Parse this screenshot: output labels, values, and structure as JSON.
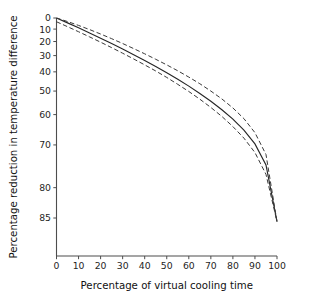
{
  "figure": {
    "background_color": "#ffffff",
    "axis_color": "#4d4d4d",
    "line_color": "#262626",
    "dashed_line_color": "#3a3a3a"
  },
  "chart_data": {
    "type": "line",
    "title": "",
    "subtitle": "",
    "xlabel": "Percentage of virtual cooling time",
    "ylabel": "Percentage reduction in temperature difference",
    "grid": false,
    "legend": "none",
    "y_axis_inverted": true,
    "y_axis_scale": "nonlinear-exponential",
    "xlim": [
      0,
      100
    ],
    "ylim": [
      0,
      87
    ],
    "xticks": [
      0,
      10,
      20,
      30,
      40,
      50,
      60,
      70,
      80,
      90,
      100
    ],
    "xticklabels": [
      "0",
      "10",
      "20",
      "30",
      "40",
      "50",
      "60",
      "70",
      "80",
      "90",
      "100"
    ],
    "yticks": [
      0,
      10,
      20,
      30,
      40,
      50,
      60,
      70,
      80,
      85
    ],
    "yticklabels": [
      "0",
      "10",
      "20",
      "30",
      "40",
      "50",
      "60",
      "70",
      "80",
      "85"
    ],
    "x": [
      0,
      5,
      10,
      15,
      20,
      25,
      30,
      35,
      40,
      45,
      50,
      55,
      60,
      65,
      70,
      75,
      80,
      85,
      90,
      95,
      100
    ],
    "series": [
      {
        "name": "Mean estimate",
        "style": "solid",
        "values": [
          0.0,
          4.5,
          8.9,
          13.2,
          17.4,
          21.5,
          25.5,
          29.4,
          33.2,
          36.9,
          40.5,
          44.1,
          47.6,
          51.1,
          54.6,
          58.1,
          61.7,
          65.5,
          69.7,
          75.2,
          85.5
        ]
      },
      {
        "name": "Upper confidence limit",
        "style": "dashed",
        "values": [
          0.0,
          3.3,
          6.8,
          10.4,
          14.1,
          17.8,
          21.5,
          25.2,
          28.8,
          32.4,
          35.9,
          39.4,
          42.9,
          46.4,
          50.0,
          53.6,
          57.4,
          61.5,
          66.3,
          72.6,
          85.5
        ]
      },
      {
        "name": "Lower confidence limit",
        "style": "dashed",
        "values": [
          3.5,
          7.9,
          12.2,
          16.4,
          20.5,
          24.5,
          28.4,
          32.2,
          35.9,
          39.5,
          43.1,
          46.7,
          50.2,
          53.7,
          57.2,
          60.7,
          64.3,
          68.0,
          72.1,
          77.3,
          85.5
        ]
      }
    ]
  }
}
